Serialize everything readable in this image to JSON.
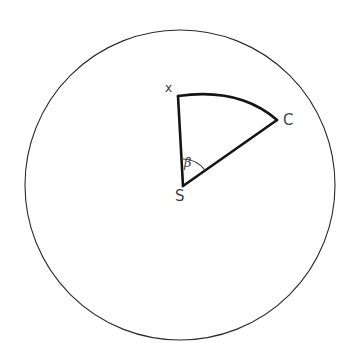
{
  "figure": {
    "kind": "geometry-diagram",
    "background_color": "#ffffff",
    "canvas": {
      "width": 354,
      "height": 358
    }
  },
  "circle": {
    "name": "outer-circle",
    "center_x": 180,
    "center_y": 185,
    "radius": 155,
    "stroke_color": "#2b2b2b",
    "stroke_width": 1.1,
    "fill": "none"
  },
  "sector": {
    "name": "sector-sxc",
    "vertex_x": 183,
    "vertex_y": 186,
    "stroke_color": "#141414",
    "stroke_width": 2.6,
    "fill": "none",
    "arc_bulge": 12,
    "points": [
      {
        "id": "X",
        "x": 178,
        "y": 96
      },
      {
        "id": "C",
        "x": 277,
        "y": 120
      },
      {
        "id": "S",
        "x": 183,
        "y": 186
      }
    ]
  },
  "angle_mark": {
    "name": "angle-arc-beta",
    "radius": 27,
    "stroke_color": "#3a3a3a",
    "stroke_width": 1.1,
    "fill": "none"
  },
  "labels": {
    "x": "x",
    "c": "C",
    "s": "S",
    "beta": "β"
  },
  "colors": {
    "ink": "#141414",
    "thin_ink": "#2b2b2b",
    "label_ink": "#3a3a3a",
    "background": "#ffffff"
  }
}
